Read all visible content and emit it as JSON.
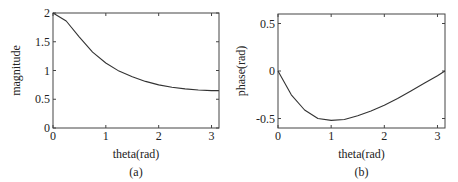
{
  "chart_data": [
    {
      "type": "line",
      "caption": "(a)",
      "title": "",
      "xlabel": "theta(rad)",
      "ylabel": "magnitude",
      "xlim": [
        0,
        3.14159
      ],
      "ylim": [
        0,
        2
      ],
      "xticks": [
        "0",
        "1",
        "2",
        "3"
      ],
      "yticks": [
        "0",
        "0.5",
        "1",
        "1.5",
        "2"
      ],
      "grid": false,
      "series": [
        {
          "name": "magnitude",
          "x": [
            0,
            0.25,
            0.5,
            0.75,
            1.0,
            1.25,
            1.5,
            1.75,
            2.0,
            2.25,
            2.5,
            2.75,
            3.0,
            3.14
          ],
          "y": [
            2.0,
            1.86,
            1.58,
            1.32,
            1.13,
            0.99,
            0.89,
            0.81,
            0.75,
            0.71,
            0.68,
            0.66,
            0.65,
            0.65
          ]
        }
      ]
    },
    {
      "type": "line",
      "caption": "(b)",
      "title": "",
      "xlabel": "theta(rad)",
      "ylabel": "phase(rad)",
      "xlim": [
        0,
        3.14159
      ],
      "ylim": [
        -0.6,
        0.6
      ],
      "xticks": [
        "0",
        "1",
        "2",
        "3"
      ],
      "yticks": [
        "-0.5",
        "0",
        "0.5"
      ],
      "grid": false,
      "series": [
        {
          "name": "phase",
          "x": [
            0,
            0.25,
            0.5,
            0.75,
            1.0,
            1.25,
            1.5,
            1.75,
            2.0,
            2.25,
            2.5,
            2.75,
            3.0,
            3.14
          ],
          "y": [
            0,
            -0.25,
            -0.41,
            -0.5,
            -0.52,
            -0.51,
            -0.47,
            -0.42,
            -0.36,
            -0.29,
            -0.21,
            -0.13,
            -0.05,
            0
          ]
        }
      ]
    }
  ]
}
